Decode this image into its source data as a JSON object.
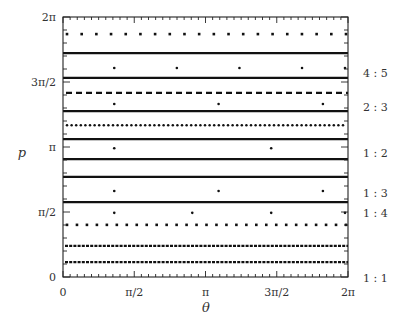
{
  "chart_data": {
    "type": "scatter",
    "title": "",
    "xlabel": "θ",
    "ylabel": "p",
    "xlim": [
      0,
      6.2832
    ],
    "ylim": [
      0,
      6.2832
    ],
    "grid": false,
    "legend_position": "none",
    "x_ticks": [
      {
        "value": 0,
        "label": "0"
      },
      {
        "value": 1.5708,
        "label": "π/2"
      },
      {
        "value": 3.1416,
        "label": "π"
      },
      {
        "value": 4.7124,
        "label": "3π/2"
      },
      {
        "value": 6.2832,
        "label": "2π"
      }
    ],
    "y_ticks": [
      {
        "value": 0,
        "label": "0"
      },
      {
        "value": 1.5708,
        "label": "π/2"
      },
      {
        "value": 3.1416,
        "label": "π"
      },
      {
        "value": 4.7124,
        "label": "3π/2"
      },
      {
        "value": 6.2832,
        "label": "2π"
      }
    ],
    "resonance_labels": [
      {
        "label": "4 : 5",
        "p": 5.03
      },
      {
        "label": "2 : 3",
        "p": 4.2
      },
      {
        "label": "1 : 2",
        "p": 3.09
      },
      {
        "label": "1 : 3",
        "p": 2.13
      },
      {
        "label": "1 : 4",
        "p": 1.55
      },
      {
        "label": "1 : 1",
        "p": 0.0
      }
    ],
    "series": [
      {
        "name": "orbit-1",
        "p": 5.87,
        "style": "spaced-dots",
        "n_points": 20
      },
      {
        "name": "orbit-2",
        "p": 5.41,
        "style": "solid"
      },
      {
        "name": "4:5 resonance",
        "p": 5.05,
        "style": "isolated-points",
        "theta": [
          1.13,
          2.51,
          3.89,
          5.27,
          6.65
        ]
      },
      {
        "name": "orbit-3",
        "p": 4.81,
        "style": "solid"
      },
      {
        "name": "orbit-4",
        "p": 4.45,
        "style": "dashed"
      },
      {
        "name": "2:3 resonance",
        "p": 4.18,
        "style": "isolated-points",
        "theta": [
          1.13,
          3.43,
          5.73
        ]
      },
      {
        "name": "orbit-5",
        "p": 4.01,
        "style": "solid"
      },
      {
        "name": "orbit-6",
        "p": 3.67,
        "style": "dense-dots"
      },
      {
        "name": "orbit-7",
        "p": 3.33,
        "style": "solid"
      },
      {
        "name": "1:2 resonance",
        "p": 3.11,
        "style": "isolated-points",
        "theta": [
          1.13,
          4.59
        ]
      },
      {
        "name": "orbit-8",
        "p": 2.85,
        "style": "solid"
      },
      {
        "name": "orbit-9",
        "p": 2.42,
        "style": "solid"
      },
      {
        "name": "1:3 resonance",
        "p": 2.08,
        "style": "isolated-points",
        "theta": [
          1.13,
          3.43,
          5.73
        ]
      },
      {
        "name": "orbit-10",
        "p": 1.81,
        "style": "solid"
      },
      {
        "name": "1:4 resonance",
        "p": 1.55,
        "style": "isolated-points",
        "theta": [
          1.13,
          2.85,
          4.59,
          6.31
        ]
      },
      {
        "name": "orbit-11",
        "p": 1.26,
        "style": "spaced-dots",
        "n_points": 29
      },
      {
        "name": "orbit-12",
        "p": 0.75,
        "style": "dense-dashes"
      },
      {
        "name": "orbit-13",
        "p": 0.36,
        "style": "dense-dashes"
      }
    ]
  }
}
